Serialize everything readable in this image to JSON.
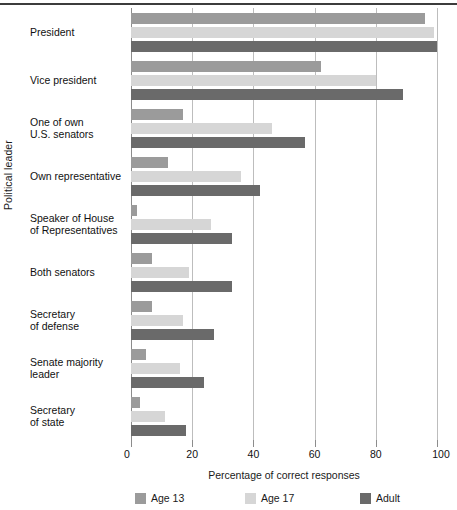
{
  "chart_data": {
    "type": "bar",
    "orientation": "horizontal",
    "title": "",
    "xlabel": "Percentage of correct responses",
    "ylabel": "Political leader",
    "xlim": [
      0,
      100
    ],
    "xticks": [
      0,
      20,
      40,
      60,
      80,
      100
    ],
    "xtick_labels": [
      "0",
      "20",
      "40",
      "60",
      "80",
      "100"
    ],
    "grid": "vertical",
    "legend_position": "bottom",
    "categories": [
      "President",
      "Vice president",
      "One of own\nU.S. senators",
      "Own representative",
      "Speaker of House\nof Representatives",
      "Both senators",
      "Secretary\nof defense",
      "Senate majority\nleader",
      "Secretary\nof state"
    ],
    "series": [
      {
        "name": "Age 13",
        "color": "#9b9b9b",
        "values": [
          96,
          62,
          17,
          12,
          2,
          7,
          7,
          5,
          3
        ]
      },
      {
        "name": "Age 17",
        "color": "#d6d6d6",
        "values": [
          99,
          80,
          46,
          36,
          26,
          19,
          17,
          16,
          11
        ]
      },
      {
        "name": "Adult",
        "color": "#6a6a6a",
        "values": [
          100,
          89,
          57,
          42,
          33,
          33,
          27,
          24,
          18
        ]
      }
    ]
  },
  "axes": {
    "y_title": "Political leader",
    "x_title": "Percentage of correct responses",
    "category_labels": [
      [
        "President"
      ],
      [
        "Vice president"
      ],
      [
        "One of own",
        "U.S. senators"
      ],
      [
        "Own representative"
      ],
      [
        "Speaker of House",
        "of Representatives"
      ],
      [
        "Both senators"
      ],
      [
        "Secretary",
        "of defense"
      ],
      [
        "Senate majority",
        "leader"
      ],
      [
        "Secretary",
        "of state"
      ]
    ],
    "tick_labels": [
      "0",
      "20",
      "40",
      "60",
      "80",
      "100"
    ]
  },
  "legend": {
    "items": [
      {
        "label": "Age 13",
        "color": "#9b9b9b"
      },
      {
        "label": "Age 17",
        "color": "#d6d6d6"
      },
      {
        "label": "Adult",
        "color": "#6a6a6a"
      }
    ]
  }
}
